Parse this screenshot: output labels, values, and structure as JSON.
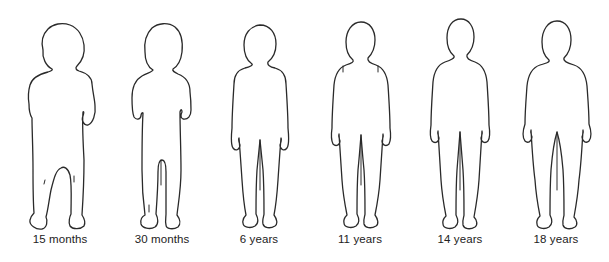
{
  "figure": {
    "stages": [
      {
        "label": "15 months",
        "center_x": 60
      },
      {
        "label": "30 months",
        "center_x": 162
      },
      {
        "label": "6 years",
        "center_x": 259
      },
      {
        "label": "11 years",
        "center_x": 360
      },
      {
        "label": "14 years",
        "center_x": 460
      },
      {
        "label": "18 years",
        "center_x": 556
      }
    ]
  },
  "colors": {
    "outline": "#2a2a2a",
    "background": "#ffffff"
  }
}
